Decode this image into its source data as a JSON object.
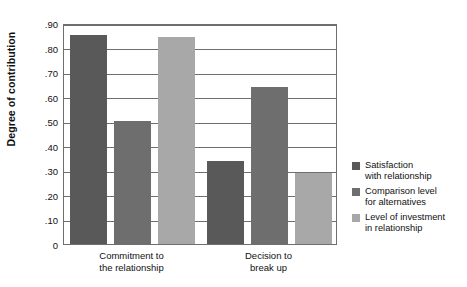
{
  "chart_data": {
    "type": "bar",
    "title": "",
    "xlabel": "",
    "ylabel": "Degree of contribution",
    "ylim": [
      0,
      0.9
    ],
    "grid": true,
    "legend_position": "right",
    "categories": [
      "Commitment to the relationship",
      "Decision to break up"
    ],
    "category_lines": [
      [
        "Commitment to",
        "the relationship"
      ],
      [
        "Decision to",
        "break up"
      ]
    ],
    "ytick_labels": [
      ".90",
      ".80",
      ".70",
      ".60",
      ".50",
      ".40",
      ".30",
      ".20",
      ".10",
      "0"
    ],
    "ytick_values": [
      0.9,
      0.8,
      0.7,
      0.6,
      0.5,
      0.4,
      0.3,
      0.2,
      0.1,
      0
    ],
    "series": [
      {
        "name": "Satisfaction with relationship",
        "name_lines": [
          "Satisfaction",
          "with relationship"
        ],
        "color": "#595959",
        "values": [
          0.85,
          0.34
        ]
      },
      {
        "name": "Comparison level for alternatives",
        "name_lines": [
          "Comparison level",
          "for alternatives"
        ],
        "color": "#6e6e6e",
        "values": [
          0.5,
          0.64
        ]
      },
      {
        "name": "Level of investment in relationship",
        "name_lines": [
          "Level of investment",
          "in relationship"
        ],
        "color": "#a8a8a8",
        "values": [
          0.845,
          0.29
        ]
      }
    ]
  },
  "colors": {
    "axis": "#6f6f6f",
    "text": "#111111",
    "background": "#ffffff"
  }
}
